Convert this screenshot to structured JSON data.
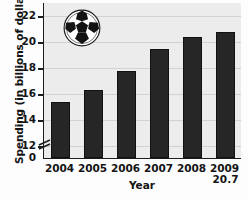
{
  "chart_data": {
    "type": "bar",
    "title": "",
    "categories": [
      "2004",
      "2005",
      "2006",
      "2007",
      "2008",
      "2009"
    ],
    "values": [
      15.3,
      16.2,
      17.7,
      19.4,
      20.3,
      20.7
    ],
    "value_labels": [
      "15.3",
      "",
      "",
      "",
      "",
      "20.7"
    ],
    "xlabel": "Year",
    "ylabel": "Spending (in billions of dollars)",
    "ylim": [
      11,
      23
    ],
    "yticks": [
      12,
      14,
      16,
      18,
      20,
      22
    ],
    "ytick_labels": [
      "12",
      "14",
      "16",
      "18",
      "20",
      "22"
    ],
    "zero_tick_label": "0",
    "axis_break": true,
    "grid": true,
    "legend": "none",
    "bar_color": "#262626",
    "plot_background": "#ececec",
    "gridline_color": "#d2d2d2",
    "axis_color": "#1d1d1d"
  },
  "decoration": {
    "soccer_ball_label": "soccer-ball"
  }
}
